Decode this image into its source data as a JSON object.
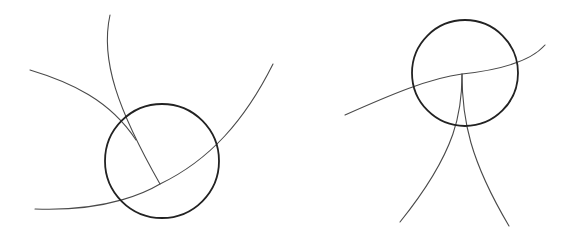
{
  "canvas": {
    "width": 577,
    "height": 236,
    "background": "#ffffff"
  },
  "colors": {
    "circle_stroke": "#222222",
    "line_stroke": "#4a4a4a"
  },
  "figures": [
    {
      "id": "left-figure",
      "description": "circle intersected by three curved lines meeting at a point inside the circle",
      "circle": {
        "cx": 162,
        "cy": 161,
        "r": 57
      },
      "curves": [
        {
          "id": "curve-steep",
          "d": "M110,15 C100,60 118,110 160,184"
        },
        {
          "id": "curve-upper-left",
          "d": "M30,70 C70,82 110,100 136,140"
        },
        {
          "id": "curve-large-arc",
          "d": "M35,209 C110,212 150,190 160,184 C210,160 245,120 273,64"
        }
      ]
    },
    {
      "id": "right-figure",
      "description": "circle crossed by a wavy line with a stem dividing into two legs below",
      "circle": {
        "cx": 465,
        "cy": 73,
        "r": 53
      },
      "curves": [
        {
          "id": "curve-wavy-horizontal",
          "d": "M345,115 C390,95 430,78 462,74 C500,70 530,62 545,45"
        },
        {
          "id": "curve-stem-left-leg",
          "d": "M462,74 C462,110 458,150 400,222"
        },
        {
          "id": "curve-right-leg",
          "d": "M462,74 C462,120 470,160 509,226"
        }
      ]
    }
  ]
}
